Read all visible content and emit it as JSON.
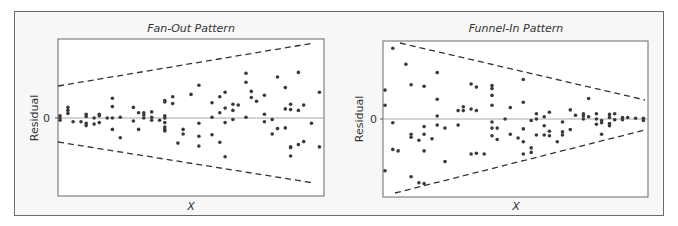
{
  "chart_data": [
    {
      "type": "scatter",
      "title": "Fan-Out Pattern",
      "xlabel": "X",
      "ylabel": "Residual",
      "yticks": [
        "0"
      ],
      "grid": false,
      "reference_line": {
        "y": 0
      },
      "envelope": {
        "style": "dashed",
        "upper": [
          [
            0.0,
            0.41
          ],
          [
            0.96,
            0.96
          ]
        ],
        "lower": [
          [
            0.0,
            -0.31
          ],
          [
            0.96,
            -0.83
          ]
        ]
      },
      "x_range": [
        0,
        1
      ],
      "y_range": [
        -1,
        1
      ],
      "points": [
        [
          0.0,
          0.0
        ],
        [
          0.0,
          -0.03
        ],
        [
          0.0,
          0.03
        ],
        [
          0.03,
          0.1
        ],
        [
          0.03,
          0.06
        ],
        [
          0.03,
          0.14
        ],
        [
          0.05,
          -0.05
        ],
        [
          0.08,
          -0.05
        ],
        [
          0.1,
          -0.1
        ],
        [
          0.1,
          -0.07
        ],
        [
          0.1,
          0.05
        ],
        [
          0.1,
          0.02
        ],
        [
          0.13,
          -0.08
        ],
        [
          0.13,
          0.0
        ],
        [
          0.15,
          -0.06
        ],
        [
          0.15,
          0.05
        ],
        [
          0.15,
          0.03
        ],
        [
          0.18,
          0.0
        ],
        [
          0.2,
          0.0
        ],
        [
          0.2,
          -0.15
        ],
        [
          0.2,
          0.15
        ],
        [
          0.2,
          0.26
        ],
        [
          0.23,
          0.01
        ],
        [
          0.23,
          -0.26
        ],
        [
          0.28,
          0.14
        ],
        [
          0.28,
          -0.04
        ],
        [
          0.3,
          0.07
        ],
        [
          0.3,
          -0.15
        ],
        [
          0.32,
          0.07
        ],
        [
          0.32,
          0.0
        ],
        [
          0.32,
          0.04
        ],
        [
          0.35,
          0.08
        ],
        [
          0.35,
          0.01
        ],
        [
          0.35,
          -0.03
        ],
        [
          0.38,
          -0.03
        ],
        [
          0.4,
          0.0
        ],
        [
          0.4,
          0.03
        ],
        [
          0.4,
          -0.06
        ],
        [
          0.4,
          -0.15
        ],
        [
          0.4,
          -0.17
        ],
        [
          0.4,
          -0.12
        ],
        [
          0.4,
          0.23
        ],
        [
          0.4,
          0.21
        ],
        [
          0.43,
          0.28
        ],
        [
          0.43,
          0.19
        ],
        [
          0.45,
          -0.33
        ],
        [
          0.47,
          -0.21
        ],
        [
          0.47,
          -0.15
        ],
        [
          0.5,
          0.31
        ],
        [
          0.53,
          0.43
        ],
        [
          0.53,
          -0.07
        ],
        [
          0.53,
          -0.24
        ],
        [
          0.53,
          -0.37
        ],
        [
          0.58,
          0.2
        ],
        [
          0.58,
          0.01
        ],
        [
          0.58,
          -0.22
        ],
        [
          0.61,
          0.07
        ],
        [
          0.61,
          0.28
        ],
        [
          0.61,
          -0.32
        ],
        [
          0.63,
          0.34
        ],
        [
          0.63,
          0.13
        ],
        [
          0.63,
          -0.06
        ],
        [
          0.63,
          -0.51
        ],
        [
          0.66,
          0.18
        ],
        [
          0.66,
          0.1
        ],
        [
          0.66,
          -0.02
        ],
        [
          0.68,
          0.17
        ],
        [
          0.71,
          0.59
        ],
        [
          0.71,
          0.47
        ],
        [
          0.71,
          0.01
        ],
        [
          0.73,
          0.35
        ],
        [
          0.73,
          0.27
        ],
        [
          0.75,
          0.22
        ],
        [
          0.78,
          0.3
        ],
        [
          0.78,
          0.05
        ],
        [
          0.78,
          -0.05
        ],
        [
          0.81,
          -0.02
        ],
        [
          0.81,
          -0.21
        ],
        [
          0.83,
          -0.14
        ],
        [
          0.83,
          0.54
        ],
        [
          0.86,
          0.4
        ],
        [
          0.86,
          0.12
        ],
        [
          0.86,
          -0.13
        ],
        [
          0.88,
          0.18
        ],
        [
          0.88,
          0.11
        ],
        [
          0.88,
          -0.39
        ],
        [
          0.88,
          -0.38
        ],
        [
          0.88,
          -0.5
        ],
        [
          0.91,
          0.6
        ],
        [
          0.91,
          0.1
        ],
        [
          0.91,
          -0.35
        ],
        [
          0.93,
          0.17
        ],
        [
          0.93,
          -0.31
        ],
        [
          0.96,
          -0.07
        ],
        [
          0.99,
          0.34
        ],
        [
          0.99,
          -0.38
        ]
      ]
    },
    {
      "type": "scatter",
      "title": "Funnel-In Pattern",
      "xlabel": "X",
      "ylabel": "Residual",
      "yticks": [
        "0"
      ],
      "grid": false,
      "reference_line": {
        "y": 0
      },
      "envelope": {
        "style": "dashed",
        "upper": [
          [
            0.05,
            0.98
          ],
          [
            0.99,
            0.24
          ]
        ],
        "lower": [
          [
            0.05,
            -0.96
          ],
          [
            0.99,
            -0.16
          ]
        ]
      },
      "x_range": [
        0,
        1
      ],
      "y_range": [
        -1,
        1
      ],
      "points": [
        [
          0.0,
          0.38
        ],
        [
          0.0,
          0.18
        ],
        [
          0.0,
          -0.68
        ],
        [
          0.03,
          0.93
        ],
        [
          0.03,
          -0.05
        ],
        [
          0.03,
          -0.4
        ],
        [
          0.05,
          -0.42
        ],
        [
          0.08,
          0.72
        ],
        [
          0.1,
          0.45
        ],
        [
          0.1,
          -0.2
        ],
        [
          0.1,
          -0.24
        ],
        [
          0.1,
          -0.76
        ],
        [
          0.13,
          -0.28
        ],
        [
          0.13,
          -0.84
        ],
        [
          0.15,
          0.43
        ],
        [
          0.15,
          -0.1
        ],
        [
          0.15,
          -0.2
        ],
        [
          0.15,
          -0.42
        ],
        [
          0.15,
          -0.85
        ],
        [
          0.18,
          -0.26
        ],
        [
          0.2,
          0.61
        ],
        [
          0.2,
          0.26
        ],
        [
          0.2,
          0.04
        ],
        [
          0.2,
          -0.08
        ],
        [
          0.23,
          -0.12
        ],
        [
          0.23,
          -0.56
        ],
        [
          0.28,
          0.11
        ],
        [
          0.28,
          -0.08
        ],
        [
          0.3,
          0.16
        ],
        [
          0.3,
          0.11
        ],
        [
          0.33,
          0.46
        ],
        [
          0.33,
          0.13
        ],
        [
          0.33,
          -0.46
        ],
        [
          0.35,
          0.42
        ],
        [
          0.35,
          0.11
        ],
        [
          0.35,
          -0.45
        ],
        [
          0.38,
          -0.46
        ],
        [
          0.41,
          0.44
        ],
        [
          0.41,
          0.4
        ],
        [
          0.41,
          0.31
        ],
        [
          0.41,
          0.18
        ],
        [
          0.41,
          -0.04
        ],
        [
          0.41,
          -0.12
        ],
        [
          0.41,
          -0.22
        ],
        [
          0.43,
          -0.12
        ],
        [
          0.43,
          -0.27
        ],
        [
          0.46,
          0.0
        ],
        [
          0.48,
          0.15
        ],
        [
          0.48,
          -0.2
        ],
        [
          0.51,
          -0.25
        ],
        [
          0.53,
          0.52
        ],
        [
          0.53,
          0.22
        ],
        [
          0.53,
          -0.13
        ],
        [
          0.53,
          -0.3
        ],
        [
          0.53,
          -0.46
        ],
        [
          0.56,
          -0.02
        ],
        [
          0.56,
          -0.38
        ],
        [
          0.56,
          -0.44
        ],
        [
          0.58,
          0.0
        ],
        [
          0.58,
          0.07
        ],
        [
          0.58,
          -0.21
        ],
        [
          0.61,
          0.03
        ],
        [
          0.61,
          -0.09
        ],
        [
          0.61,
          -0.21
        ],
        [
          0.63,
          0.09
        ],
        [
          0.63,
          -0.16
        ],
        [
          0.63,
          -0.22
        ],
        [
          0.66,
          -0.3
        ],
        [
          0.68,
          -0.04
        ],
        [
          0.68,
          -0.17
        ],
        [
          0.68,
          -0.21
        ],
        [
          0.71,
          0.12
        ],
        [
          0.71,
          -0.14
        ],
        [
          0.73,
          0.05
        ],
        [
          0.76,
          0.07
        ],
        [
          0.76,
          0.04
        ],
        [
          0.76,
          0.0
        ],
        [
          0.78,
          0.27
        ],
        [
          0.78,
          0.03
        ],
        [
          0.81,
          0.07
        ],
        [
          0.81,
          0.0
        ],
        [
          0.81,
          -0.07
        ],
        [
          0.83,
          -0.02
        ],
        [
          0.83,
          -0.05
        ],
        [
          0.83,
          -0.2
        ],
        [
          0.86,
          0.06
        ],
        [
          0.86,
          0.02
        ],
        [
          0.86,
          -0.06
        ],
        [
          0.86,
          -0.09
        ],
        [
          0.88,
          0.07
        ],
        [
          0.88,
          -0.01
        ],
        [
          0.91,
          0.02
        ],
        [
          0.91,
          -0.01
        ],
        [
          0.93,
          0.02
        ],
        [
          0.96,
          0.01
        ],
        [
          0.99,
          0.01
        ],
        [
          0.99,
          -0.02
        ]
      ]
    }
  ],
  "panels": [
    {
      "title": "Fan-Out Pattern",
      "ylabel": "Residual",
      "xlabel": "X",
      "ytick": "0"
    },
    {
      "title": "Funnel-In Pattern",
      "ylabel": "Residual",
      "xlabel": "X",
      "ytick": "0"
    }
  ],
  "colors": {
    "point": "#3a3a3a",
    "zero_line": "#a8a8a8",
    "dashed": "#333333",
    "box": "#6b6b6b",
    "frame_bg": "#f7f7f7"
  }
}
